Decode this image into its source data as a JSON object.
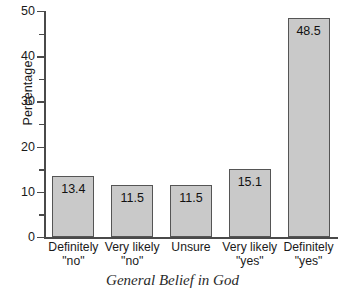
{
  "chart_data": {
    "type": "bar",
    "title": "",
    "xlabel": "General Belief in God",
    "ylabel": "Percentage",
    "categories": [
      {
        "line1": "Definitely",
        "line2": "\"no\""
      },
      {
        "line1": "Very likely",
        "line2": "\"no\""
      },
      {
        "line1": "Unsure",
        "line2": ""
      },
      {
        "line1": "Very likely",
        "line2": "\"yes\""
      },
      {
        "line1": "Definitely",
        "line2": "\"yes\""
      }
    ],
    "values": [
      13.4,
      11.5,
      11.5,
      15.1,
      48.5
    ],
    "value_labels": [
      "13.4",
      "11.5",
      "11.5",
      "15.1",
      "48.5"
    ],
    "ylim": [
      0,
      50
    ],
    "ytick_labels": [
      "0",
      "10",
      "20",
      "30",
      "40",
      "50"
    ],
    "ytick_values": [
      0,
      10,
      20,
      30,
      40,
      50
    ],
    "yminor_values": [
      5,
      15,
      25,
      35,
      45
    ],
    "grid": false,
    "legend": null,
    "bar_color": "#c9c9c9",
    "bar_edge_color": "#555555",
    "axis_color": "#4a4a4a"
  }
}
